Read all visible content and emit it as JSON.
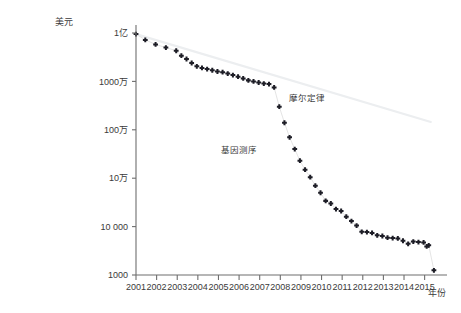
{
  "chart_data": {
    "type": "scatter",
    "title": "",
    "xlabel": "年份",
    "ylabel": "美元",
    "yscale": "log",
    "ylim": [
      1000,
      100000000
    ],
    "xlim": [
      2001,
      2015.6
    ],
    "grid": false,
    "legend_position": "inline-annotation",
    "y_ticks": [
      {
        "value": 100000000,
        "label": "1亿"
      },
      {
        "value": 10000000,
        "label": "1000万"
      },
      {
        "value": 1000000,
        "label": "100万"
      },
      {
        "value": 100000,
        "label": "10万"
      },
      {
        "value": 10000,
        "label": "10 000"
      },
      {
        "value": 1000,
        "label": "1000"
      }
    ],
    "x_ticks": [
      "2001",
      "2002",
      "2003",
      "2004",
      "2005",
      "2006",
      "2007",
      "2008",
      "2009",
      "2010",
      "2011",
      "2012",
      "2013",
      "2014",
      "2015"
    ],
    "series": [
      {
        "name": "摩尔定律",
        "type": "line",
        "color": "#eceef0",
        "label_x": 2008.4,
        "label_y": 4000000,
        "points": [
          {
            "x": 2001.0,
            "y": 95000000
          },
          {
            "x": 2015.3,
            "y": 1450000
          }
        ]
      },
      {
        "name": "基因测序",
        "type": "scatter",
        "color": "#1d1d26",
        "label_x": 2006.0,
        "label_y": 330000,
        "points": [
          {
            "x": 2001.0,
            "y": 95000000
          },
          {
            "x": 2001.45,
            "y": 72000000
          },
          {
            "x": 2001.95,
            "y": 58000000
          },
          {
            "x": 2002.45,
            "y": 50000000
          },
          {
            "x": 2002.95,
            "y": 43000000
          },
          {
            "x": 2003.2,
            "y": 34000000
          },
          {
            "x": 2003.45,
            "y": 29000000
          },
          {
            "x": 2003.7,
            "y": 24000000
          },
          {
            "x": 2003.95,
            "y": 20500000
          },
          {
            "x": 2004.2,
            "y": 19000000
          },
          {
            "x": 2004.45,
            "y": 18000000
          },
          {
            "x": 2004.7,
            "y": 17000000
          },
          {
            "x": 2004.95,
            "y": 16000000
          },
          {
            "x": 2005.2,
            "y": 15500000
          },
          {
            "x": 2005.45,
            "y": 14500000
          },
          {
            "x": 2005.7,
            "y": 13500000
          },
          {
            "x": 2005.95,
            "y": 12500000
          },
          {
            "x": 2006.2,
            "y": 11500000
          },
          {
            "x": 2006.45,
            "y": 10500000
          },
          {
            "x": 2006.7,
            "y": 10000000
          },
          {
            "x": 2006.95,
            "y": 9500000
          },
          {
            "x": 2007.2,
            "y": 9000000
          },
          {
            "x": 2007.45,
            "y": 8800000
          },
          {
            "x": 2007.7,
            "y": 7500000
          },
          {
            "x": 2007.95,
            "y": 3000000
          },
          {
            "x": 2008.2,
            "y": 1400000
          },
          {
            "x": 2008.45,
            "y": 700000
          },
          {
            "x": 2008.7,
            "y": 400000
          },
          {
            "x": 2008.95,
            "y": 230000
          },
          {
            "x": 2009.2,
            "y": 150000
          },
          {
            "x": 2009.45,
            "y": 105000
          },
          {
            "x": 2009.7,
            "y": 70000
          },
          {
            "x": 2009.95,
            "y": 50000
          },
          {
            "x": 2010.2,
            "y": 34000
          },
          {
            "x": 2010.45,
            "y": 30000
          },
          {
            "x": 2010.7,
            "y": 23000
          },
          {
            "x": 2010.95,
            "y": 21000
          },
          {
            "x": 2011.2,
            "y": 16000
          },
          {
            "x": 2011.45,
            "y": 13000
          },
          {
            "x": 2011.7,
            "y": 10500
          },
          {
            "x": 2011.95,
            "y": 7800
          },
          {
            "x": 2012.2,
            "y": 7700
          },
          {
            "x": 2012.45,
            "y": 7400
          },
          {
            "x": 2012.7,
            "y": 6600
          },
          {
            "x": 2012.95,
            "y": 6400
          },
          {
            "x": 2013.2,
            "y": 5900
          },
          {
            "x": 2013.45,
            "y": 5800
          },
          {
            "x": 2013.7,
            "y": 5700
          },
          {
            "x": 2013.95,
            "y": 5100
          },
          {
            "x": 2014.2,
            "y": 4400
          },
          {
            "x": 2014.45,
            "y": 4900
          },
          {
            "x": 2014.7,
            "y": 4800
          },
          {
            "x": 2014.95,
            "y": 4700
          },
          {
            "x": 2015.1,
            "y": 3900
          },
          {
            "x": 2015.2,
            "y": 4100
          },
          {
            "x": 2015.45,
            "y": 1250
          }
        ]
      }
    ]
  }
}
